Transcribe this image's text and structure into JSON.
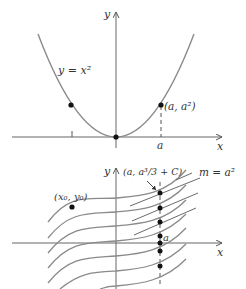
{
  "top_graph": {
    "x_axis_label": "x",
    "y_axis_label": "y",
    "curve_label": "y = x²",
    "point_label": "(a, a²)",
    "tick_label_a": "a"
  },
  "bottom_graph": {
    "x_axis_label": "x",
    "y_axis_label": "y",
    "initial_point_label": "(x₀, y₀)",
    "point_label": "(a, a³/3 + C)",
    "slope_label": "m = a²",
    "tick_label_a": "a"
  },
  "colors": {
    "curve": "#7a7a7a",
    "axis": "#555555",
    "dot": "#111111",
    "text": "#333333"
  }
}
